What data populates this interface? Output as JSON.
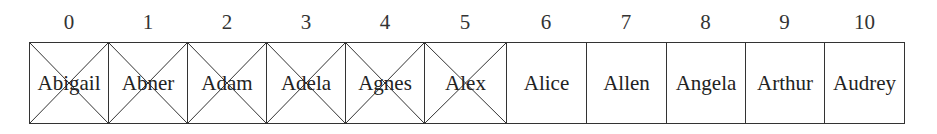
{
  "diagram": {
    "type": "array",
    "cells": [
      {
        "index": "0",
        "name": "Abigail",
        "crossed": true
      },
      {
        "index": "1",
        "name": "Abner",
        "crossed": true
      },
      {
        "index": "2",
        "name": "Adam",
        "crossed": true
      },
      {
        "index": "3",
        "name": "Adela",
        "crossed": true
      },
      {
        "index": "4",
        "name": "Agnes",
        "crossed": true
      },
      {
        "index": "5",
        "name": "Alex",
        "crossed": true
      },
      {
        "index": "6",
        "name": "Alice",
        "crossed": false
      },
      {
        "index": "7",
        "name": "Allen",
        "crossed": false
      },
      {
        "index": "8",
        "name": "Angela",
        "crossed": false
      },
      {
        "index": "9",
        "name": "Arthur",
        "crossed": false
      },
      {
        "index": "10",
        "name": "Audrey",
        "crossed": false
      }
    ],
    "colors": {
      "line": "#333333",
      "text": "#222222",
      "background": "#ffffff"
    }
  }
}
